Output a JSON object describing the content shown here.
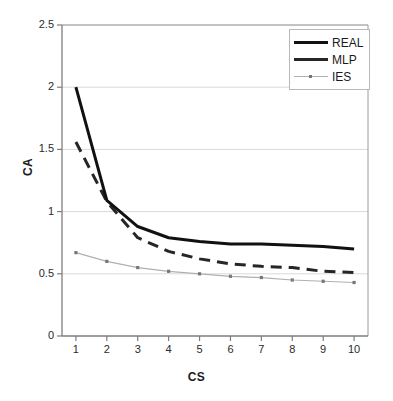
{
  "chart_data": {
    "type": "line",
    "title": "",
    "xlabel": "CS",
    "ylabel": "CA",
    "x": [
      1,
      2,
      3,
      4,
      5,
      6,
      7,
      8,
      9,
      10
    ],
    "xtick_labels": [
      "1",
      "2",
      "3",
      "4",
      "5",
      "6",
      "7",
      "8",
      "9",
      "10"
    ],
    "ytick_labels": [
      "0",
      "0.5",
      "1",
      "1.5",
      "2",
      "2.5"
    ],
    "ytick_values": [
      0,
      0.5,
      1,
      1.5,
      2,
      2.5
    ],
    "xlim": [
      0.55,
      10.45
    ],
    "ylim": [
      0,
      2.5
    ],
    "grid": "horizontal",
    "legend_position": "top-right",
    "series": [
      {
        "name": "REAL",
        "style": "solid",
        "color": "#111111",
        "width": 3,
        "markers": false,
        "values": [
          2.0,
          1.09,
          0.88,
          0.79,
          0.76,
          0.74,
          0.74,
          0.73,
          0.72,
          0.7
        ]
      },
      {
        "name": "MLP",
        "style": "dashed",
        "color": "#262626",
        "width": 3,
        "markers": false,
        "values": [
          1.56,
          1.08,
          0.79,
          0.68,
          0.62,
          0.58,
          0.56,
          0.55,
          0.52,
          0.51
        ]
      },
      {
        "name": "IES",
        "style": "solid-thin",
        "color": "#b0b0b0",
        "width": 1.2,
        "markers": true,
        "marker_color": "#777777",
        "values": [
          0.67,
          0.6,
          0.55,
          0.52,
          0.5,
          0.48,
          0.47,
          0.45,
          0.44,
          0.43
        ]
      }
    ]
  },
  "legend": {
    "items": [
      {
        "label": "REAL"
      },
      {
        "label": "MLP"
      },
      {
        "label": "IES"
      }
    ]
  },
  "axes": {
    "x_title": "CS",
    "y_title": "CA"
  },
  "colors": {
    "background": "#ffffff",
    "axis": "#808080",
    "grid": "#d9d9d9",
    "text": "#1a1a1a"
  }
}
